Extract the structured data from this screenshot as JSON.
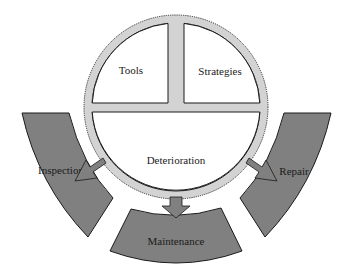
{
  "diagram": {
    "type": "cycle",
    "center_circle": {
      "quadrants": {
        "top_left": "Tools",
        "top_right": "Strategies",
        "bottom": "Deterioration"
      }
    },
    "outer_segments": [
      {
        "id": "inspection",
        "label": "Inspection",
        "position": "left"
      },
      {
        "id": "maintenance",
        "label": "Maintenance",
        "position": "bottom"
      },
      {
        "id": "repair",
        "label": "Repair",
        "position": "right"
      }
    ],
    "arrows": [
      {
        "from": "Deterioration",
        "to": "Inspection"
      },
      {
        "from": "Deterioration",
        "to": "Maintenance"
      },
      {
        "from": "Deterioration",
        "to": "Repair"
      }
    ],
    "colors": {
      "segment_fill": "#808080",
      "ring_fill": "#d3d3d3",
      "outline": "#1a1a1a",
      "background": "#ffffff"
    }
  }
}
